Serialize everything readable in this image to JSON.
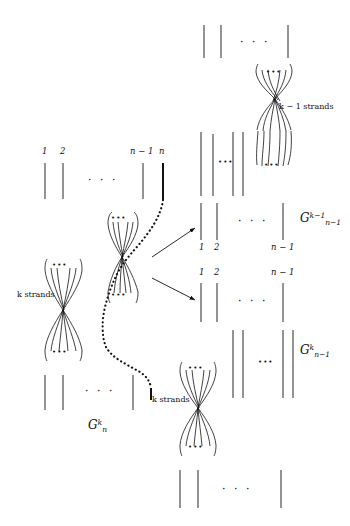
{
  "figure": {
    "type": "braid-group-diagram",
    "background_color": "#ffffff",
    "stroke_color": "#111111",
    "width": 350,
    "height": 526
  },
  "labels": {
    "top_left_indices": [
      "1",
      "2",
      "n − 1",
      "n"
    ],
    "right_upper_indices": [
      "1",
      "2",
      "n − 1"
    ],
    "right_lower_indices": [
      "1",
      "2",
      "n − 1"
    ],
    "k_strands": "k strands",
    "k_minus_1_strands": "k − 1 strands",
    "ellipsis": "· · ·",
    "mini_ellipsis": "•••"
  },
  "groups": {
    "source": {
      "base": "G",
      "sub": "n",
      "sup": "k"
    },
    "target_upper": {
      "base": "G",
      "sub": "n−1",
      "sup": "k−1"
    },
    "target_lower": {
      "base": "G",
      "sub": "n−1",
      "sup": "k"
    }
  },
  "arrows": {
    "upper": {
      "direction": "up-right"
    },
    "lower": {
      "direction": "down-right"
    }
  }
}
